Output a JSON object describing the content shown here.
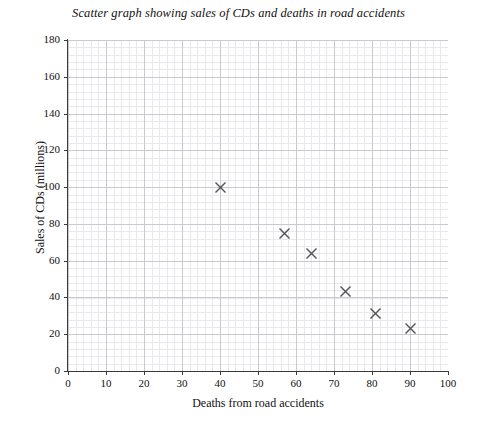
{
  "chart_data": {
    "type": "scatter",
    "title": "Scatter graph showing sales of CDs and deaths in road accidents",
    "xlabel": "Deaths from road accidents",
    "ylabel": "Sales of CDs (millions)",
    "xlim": [
      0,
      100
    ],
    "ylim": [
      0,
      180
    ],
    "x_ticks": [
      0,
      10,
      20,
      30,
      40,
      50,
      60,
      70,
      80,
      90,
      100
    ],
    "y_ticks": [
      0,
      20,
      40,
      60,
      80,
      100,
      120,
      140,
      160,
      180
    ],
    "x_tick_labels": [
      "0",
      "10",
      "20",
      "30",
      "40",
      "50",
      "60",
      "70",
      "80",
      "90",
      "100"
    ],
    "y_tick_labels": [
      "0",
      "20",
      "40",
      "60",
      "80",
      "100",
      "120",
      "140",
      "160",
      "180"
    ],
    "grid": "major-and-minor",
    "minor_divisions": 5,
    "legend": "none",
    "marker": "x-cross",
    "marker_color": "#555555",
    "points": [
      {
        "x": 40,
        "y": 100
      },
      {
        "x": 57,
        "y": 75
      },
      {
        "x": 64,
        "y": 64
      },
      {
        "x": 73,
        "y": 43
      },
      {
        "x": 81,
        "y": 31
      },
      {
        "x": 90,
        "y": 23
      }
    ]
  },
  "figure": {
    "background_color": "#ffffff",
    "axis_color": "#3a3a3a",
    "grid_major_color": "#c9c9cf",
    "grid_minor_color": "#e9e9ec"
  }
}
